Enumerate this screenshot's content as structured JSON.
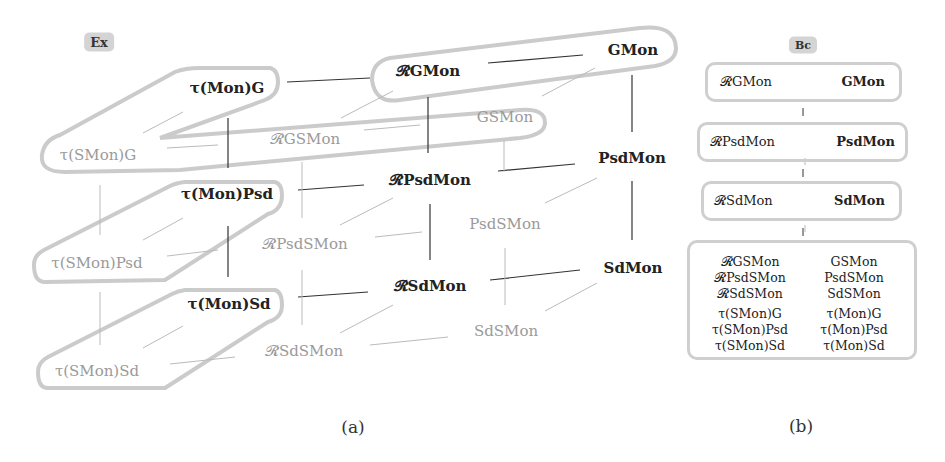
{
  "panel_a": {
    "tag": "Ex",
    "caption": "(a)",
    "nodes": {
      "tMonG": "τ(Mon)G",
      "RGMon": "𝓡GMon",
      "GMon": "GMon",
      "tSMonG": "τ(SMon)G",
      "RGSMon": "𝓡GSMon",
      "GSMon": "GSMon",
      "tMonPsd": "τ(Mon)Psd",
      "RPsdMon": "𝓡PsdMon",
      "PsdMon": "PsdMon",
      "tSMonPsd": "τ(SMon)Psd",
      "RPsdSMon": "𝓡PsdSMon",
      "PsdSMon": "PsdSMon",
      "tMonSd": "τ(Mon)Sd",
      "RSdMon": "𝓡SdMon",
      "SdMon": "SdMon",
      "tSMonSd": "τ(SMon)Sd",
      "RSdSMon": "𝓡SdSMon",
      "SdSMon": "SdSMon"
    }
  },
  "panel_b": {
    "tag": "Bc",
    "caption": "(b)",
    "boxes": [
      {
        "left": "𝓡GMon",
        "right": "GMon"
      },
      {
        "left": "𝓡PsdMon",
        "right": "PsdMon"
      },
      {
        "left": "𝓡SdMon",
        "right": "SdMon"
      }
    ],
    "bottom": {
      "group1": [
        [
          "𝓡GSMon",
          "GSMon"
        ],
        [
          "𝓡PsdSMon",
          "PsdSMon"
        ],
        [
          "𝓡SdSMon",
          "SdSMon"
        ]
      ],
      "group2": [
        [
          "τ(SMon)G",
          "τ(Mon)G"
        ],
        [
          "τ(SMon)Psd",
          "τ(Mon)Psd"
        ],
        [
          "τ(SMon)Sd",
          "τ(Mon)Sd"
        ]
      ]
    }
  }
}
